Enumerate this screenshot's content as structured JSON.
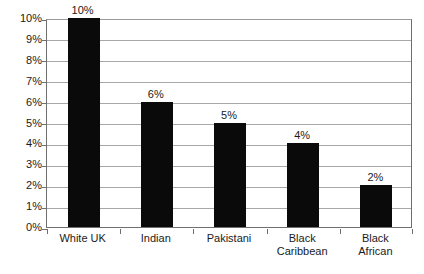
{
  "chart_data": {
    "type": "bar",
    "title": "",
    "subtitle": "",
    "xlabel": "",
    "ylabel": "",
    "categories": [
      "White UK",
      "Indian",
      "Pakistani",
      "Black Caribbean",
      "Black African"
    ],
    "category_lines": [
      [
        "White UK"
      ],
      [
        "Indian"
      ],
      [
        "Pakistani"
      ],
      [
        "Black",
        "Caribbean"
      ],
      [
        "Black",
        "African"
      ]
    ],
    "values": [
      10,
      6,
      5,
      4,
      2
    ],
    "value_labels": [
      "10%",
      "6%",
      "5%",
      "4%",
      "2%"
    ],
    "ylim": [
      0,
      10
    ],
    "ytick_values": [
      0,
      1,
      2,
      3,
      4,
      5,
      6,
      7,
      8,
      9,
      10
    ],
    "ytick_labels": [
      "0%",
      "1%",
      "2%",
      "3%",
      "4%",
      "5%",
      "6%",
      "7%",
      "8%",
      "9%",
      "10%"
    ],
    "grid": true,
    "grid_axis": "y",
    "legend": false,
    "legend_position": "none",
    "bar_color": "#0a0a0a",
    "grid_color": "#a8a8a8",
    "axis_color": "#6f6f6f",
    "background_color": "#ffffff",
    "text_color": "#1a1a1a",
    "annotations": []
  }
}
